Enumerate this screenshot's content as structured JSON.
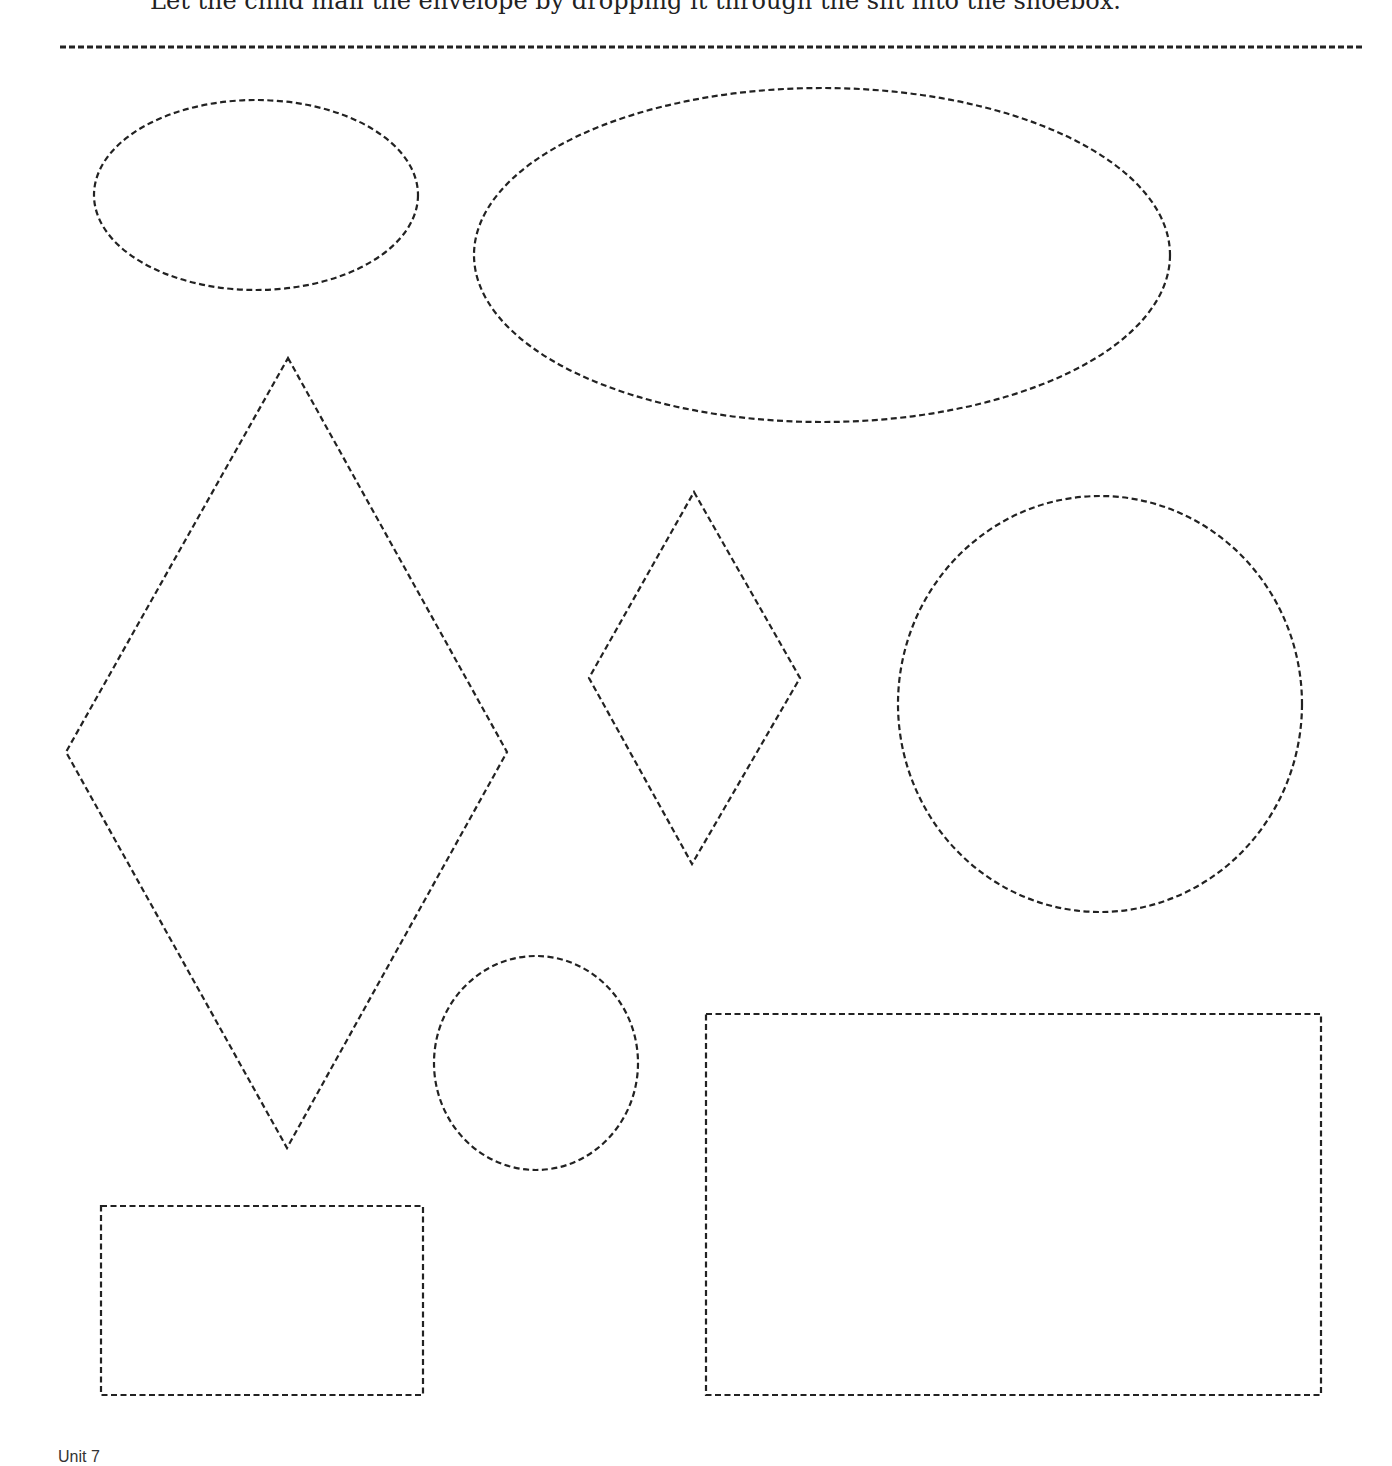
{
  "page": {
    "instruction": "Let the child mail the envelope by dropping it through the slit into the shoebox.",
    "footer": "Unit 7"
  },
  "style": {
    "stroke_color": "#222222",
    "background": "#ffffff"
  },
  "shapes": [
    {
      "type": "ellipse",
      "name": "small-ellipse",
      "cx": 256,
      "cy": 195,
      "rx": 162,
      "ry": 95
    },
    {
      "type": "ellipse",
      "name": "large-ellipse",
      "cx": 822,
      "cy": 255,
      "rx": 348,
      "ry": 167
    },
    {
      "type": "diamond",
      "name": "large-diamond",
      "points": "288,358 507,752 287,1148 66,752"
    },
    {
      "type": "diamond",
      "name": "small-diamond",
      "points": "694,492 800,678 692,864 589,678"
    },
    {
      "type": "circle",
      "name": "large-circle",
      "cx": 1100,
      "cy": 704,
      "rx": 202,
      "ry": 208
    },
    {
      "type": "circle",
      "name": "small-circle",
      "cx": 536,
      "cy": 1063,
      "rx": 102,
      "ry": 107
    },
    {
      "type": "rectangle",
      "name": "small-rectangle",
      "x": 101,
      "y": 1206,
      "w": 322,
      "h": 189
    },
    {
      "type": "rectangle",
      "name": "large-rectangle",
      "x": 706,
      "y": 1014,
      "w": 615,
      "h": 381
    }
  ]
}
